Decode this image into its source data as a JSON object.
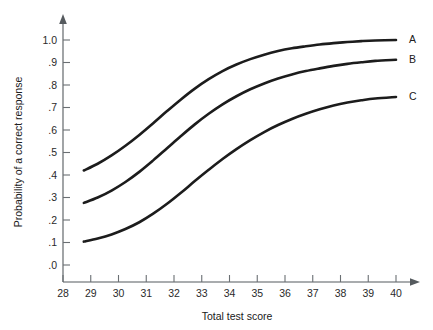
{
  "chart_data": {
    "type": "line",
    "title": "",
    "xlabel": "Total test score",
    "ylabel": "Probability of a correct response",
    "xlim": [
      28,
      40
    ],
    "ylim": [
      0.0,
      1.0
    ],
    "grid": false,
    "legend_position": "right-of-curve-ends",
    "x_ticks": [
      28,
      29,
      30,
      31,
      32,
      33,
      34,
      35,
      36,
      37,
      38,
      39,
      40
    ],
    "x_tick_labels": [
      "28",
      "29",
      "30",
      "31",
      "32",
      "33",
      "34",
      "35",
      "36",
      "37",
      "38",
      "39",
      "40"
    ],
    "y_ticks": [
      0.0,
      0.1,
      0.2,
      0.3,
      0.4,
      0.5,
      0.6,
      0.7,
      0.8,
      0.9,
      1.0
    ],
    "y_tick_labels": [
      ".0",
      ".1",
      ".2",
      ".3",
      ".4",
      ".5",
      ".6",
      ".7",
      ".8",
      ".9",
      "1.0"
    ],
    "x": [
      28.75,
      29.25,
      29.75,
      30.25,
      30.75,
      31.25,
      31.75,
      32.25,
      32.75,
      33.25,
      33.75,
      34.25,
      34.75,
      35.25,
      35.75,
      36.25,
      36.75,
      37.25,
      37.75,
      38.25,
      38.75,
      39.25,
      40.0
    ],
    "series": [
      {
        "name": "A",
        "label": "A",
        "color": "#1c1c1c",
        "values": [
          0.42,
          0.45,
          0.487,
          0.53,
          0.578,
          0.63,
          0.684,
          0.736,
          0.784,
          0.826,
          0.862,
          0.891,
          0.915,
          0.935,
          0.951,
          0.963,
          0.972,
          0.98,
          0.986,
          0.991,
          0.995,
          0.998,
          1.0
        ]
      },
      {
        "name": "B",
        "label": "B",
        "color": "#1c1c1c",
        "values": [
          0.276,
          0.3,
          0.331,
          0.369,
          0.414,
          0.465,
          0.519,
          0.573,
          0.625,
          0.672,
          0.714,
          0.75,
          0.781,
          0.807,
          0.829,
          0.847,
          0.862,
          0.874,
          0.885,
          0.894,
          0.901,
          0.907,
          0.912
        ]
      },
      {
        "name": "C",
        "label": "C",
        "color": "#1c1c1c",
        "values": [
          0.104,
          0.118,
          0.136,
          0.16,
          0.19,
          0.228,
          0.272,
          0.321,
          0.373,
          0.423,
          0.471,
          0.515,
          0.555,
          0.591,
          0.622,
          0.649,
          0.672,
          0.692,
          0.709,
          0.722,
          0.732,
          0.74,
          0.747
        ]
      }
    ]
  },
  "axis": {
    "x_title": "Total test score",
    "y_title": "Probability of a correct response"
  }
}
